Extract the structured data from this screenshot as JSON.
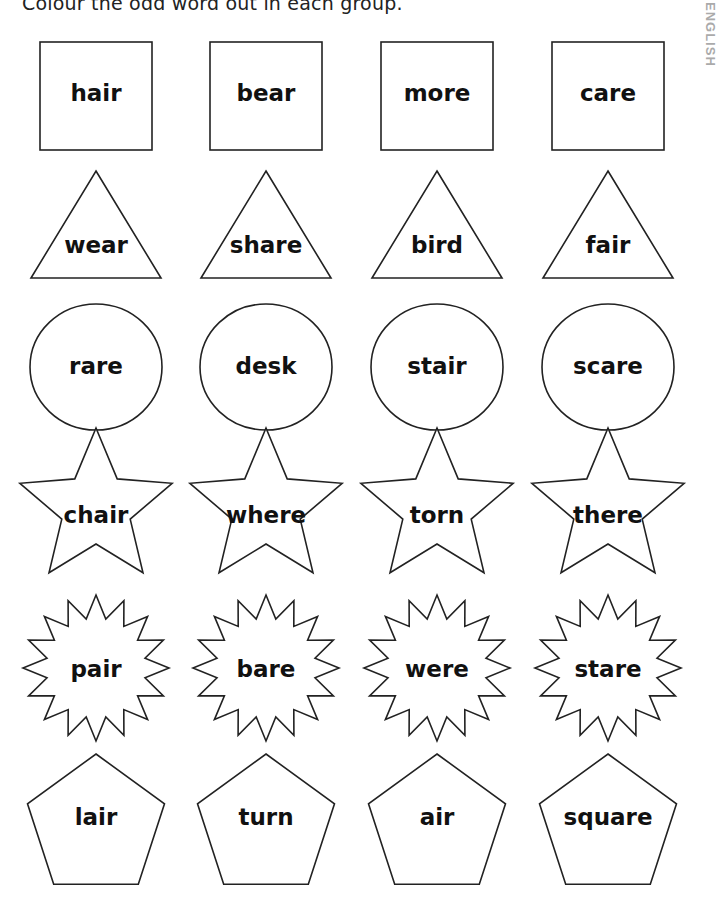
{
  "instruction": "Colour the odd word out in each group.",
  "side_label": "ENGLISH",
  "groups": [
    {
      "shape": "square",
      "words": [
        "hair",
        "bear",
        "more",
        "care"
      ]
    },
    {
      "shape": "triangle",
      "words": [
        "wear",
        "share",
        "bird",
        "fair"
      ]
    },
    {
      "shape": "circle",
      "words": [
        "rare",
        "desk",
        "stair",
        "scare"
      ]
    },
    {
      "shape": "star",
      "words": [
        "chair",
        "where",
        "torn",
        "there"
      ]
    },
    {
      "shape": "burst",
      "words": [
        "pair",
        "bare",
        "were",
        "stare"
      ]
    },
    {
      "shape": "pentagon",
      "words": [
        "lair",
        "turn",
        "air",
        "square"
      ]
    }
  ]
}
